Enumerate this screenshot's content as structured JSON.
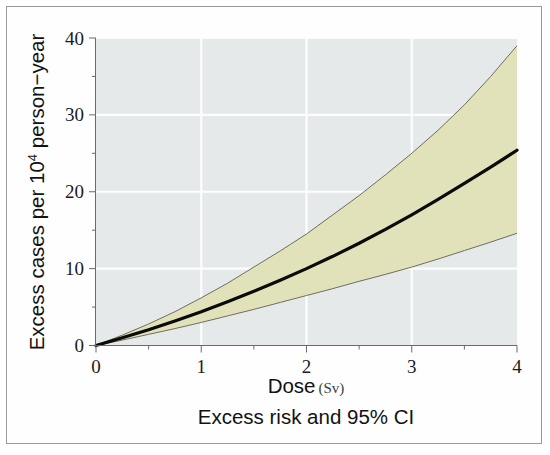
{
  "chart_data": {
    "type": "line",
    "title": "",
    "caption": "Excess risk and 95% CI",
    "xlabel": "Dose",
    "xlabel_unit": "(Sv)",
    "ylabel": "Excess cases per 10⁴ person−year",
    "ylabel_main": "Excess cases per 10",
    "ylabel_exponent": "4",
    "ylabel_tail": " person−year",
    "xlim": [
      0,
      4
    ],
    "ylim": [
      0,
      40
    ],
    "xticks": [
      0,
      1,
      2,
      3,
      4
    ],
    "xtick_labels": [
      "0",
      "1",
      "2",
      "3",
      "4"
    ],
    "yticks": [
      0,
      10,
      20,
      30,
      40
    ],
    "ytick_labels": [
      "0",
      "10",
      "20",
      "30",
      "40"
    ],
    "x_minor_ticks": [
      0.5,
      1.5,
      2.5,
      3.5
    ],
    "y_minor_ticks": [
      5,
      15,
      25,
      35
    ],
    "grid": true,
    "grid_color": "#fdfdfd",
    "plot_background": "#e5e9ea",
    "band_fill": "#e2e2ba",
    "band_edge_color": "#6e6e5c",
    "line_color": "#0a0a0a",
    "legend": [],
    "x": [
      0,
      0.25,
      0.5,
      0.75,
      1,
      1.25,
      1.5,
      1.75,
      2,
      2.25,
      2.5,
      2.75,
      3,
      3.25,
      3.5,
      3.75,
      4
    ],
    "series": [
      {
        "name": "Excess risk (central estimate)",
        "role": "central",
        "values": [
          0,
          1.0,
          2.05,
          3.2,
          4.4,
          5.7,
          7.05,
          8.5,
          10.0,
          11.6,
          13.3,
          15.1,
          17.0,
          19.0,
          21.1,
          23.2,
          25.4
        ]
      },
      {
        "name": "Upper 95% confidence limit",
        "role": "upper",
        "values": [
          0,
          1.35,
          2.8,
          4.4,
          6.2,
          8.1,
          10.2,
          12.3,
          14.5,
          17.0,
          19.5,
          22.2,
          25.0,
          28.0,
          31.3,
          35.0,
          39.0
        ]
      },
      {
        "name": "Lower 95% confidence limit",
        "role": "lower",
        "values": [
          0,
          0.7,
          1.45,
          2.2,
          3.0,
          3.85,
          4.7,
          5.6,
          6.5,
          7.4,
          8.35,
          9.25,
          10.2,
          11.25,
          12.35,
          13.45,
          14.6
        ]
      }
    ]
  },
  "figure": {
    "caption_text": "Excess risk and 95% CI"
  }
}
